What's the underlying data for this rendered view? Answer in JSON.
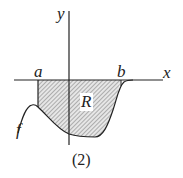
{
  "figure": {
    "axis_x_label": "x",
    "axis_y_label": "y",
    "point_a_label": "a",
    "point_b_label": "b",
    "region_label": "R",
    "function_label": "f",
    "caption": "(2)"
  },
  "colors": {
    "stroke": "#222222",
    "hatch": "#555555",
    "region_fill": "#e6e6e6",
    "background": "#ffffff"
  }
}
